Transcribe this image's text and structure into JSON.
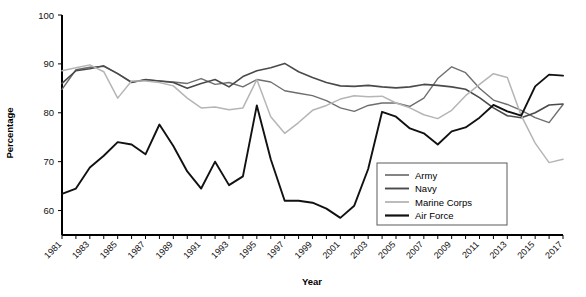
{
  "chart_data": {
    "type": "line",
    "title": "",
    "xlabel": "Year",
    "ylabel": "Percentage",
    "xlim": [
      1981,
      2017
    ],
    "ylim": [
      55,
      100
    ],
    "y_ticks": [
      60,
      70,
      80,
      90,
      100
    ],
    "grid": false,
    "legend_position": "bottom-right",
    "x": [
      1981,
      1982,
      1983,
      1984,
      1985,
      1986,
      1987,
      1988,
      1989,
      1990,
      1991,
      1992,
      1993,
      1994,
      1995,
      1996,
      1997,
      1998,
      1999,
      2000,
      2001,
      2002,
      2003,
      2004,
      2005,
      2006,
      2007,
      2008,
      2009,
      2010,
      2011,
      2012,
      2013,
      2014,
      2015,
      2016,
      2017
    ],
    "x_tick_labels": [
      "1981",
      "1983",
      "1985",
      "1987",
      "1989",
      "1991",
      "1993",
      "1995",
      "1997",
      "1999",
      "2001",
      "2003",
      "2005",
      "2007",
      "2009",
      "2011",
      "2013",
      "2015",
      "2017"
    ],
    "series": [
      {
        "name": "Army",
        "color": "#6e6e6e",
        "width": 1.4,
        "values": [
          84.8,
          88.8,
          89.3,
          89.5,
          88.0,
          86.3,
          86.7,
          86.5,
          86.3,
          86.0,
          87.0,
          85.8,
          86.2,
          85.3,
          86.8,
          86.3,
          84.5,
          84.0,
          83.5,
          82.5,
          81.0,
          80.3,
          81.5,
          82.0,
          82.0,
          81.3,
          83.0,
          87.0,
          89.4,
          88.2,
          85.0,
          82.6,
          81.7,
          80.5,
          79.0,
          78.0,
          81.7
        ]
      },
      {
        "name": "Navy",
        "color": "#4a4a4a",
        "width": 1.6,
        "values": [
          86.0,
          88.6,
          89.0,
          89.6,
          88.0,
          86.2,
          86.8,
          86.5,
          86.2,
          85.0,
          86.0,
          86.8,
          85.3,
          87.4,
          88.6,
          89.2,
          90.1,
          88.4,
          87.2,
          86.2,
          85.5,
          85.4,
          85.6,
          85.3,
          85.1,
          85.3,
          85.8,
          85.6,
          85.3,
          84.8,
          83.1,
          81.0,
          79.4,
          79.0,
          80.0,
          81.6,
          81.8
        ]
      },
      {
        "name": "Marine Corps",
        "color": "#b5b5b5",
        "width": 1.5,
        "values": [
          88.6,
          89.2,
          89.8,
          88.4,
          83.0,
          86.5,
          86.5,
          86.2,
          85.5,
          83.0,
          81.0,
          81.2,
          80.6,
          81.0,
          86.8,
          79.2,
          75.8,
          78.0,
          80.5,
          81.5,
          82.8,
          83.5,
          83.3,
          83.4,
          82.0,
          81.0,
          79.6,
          78.8,
          80.5,
          83.5,
          85.8,
          88.0,
          87.2,
          79.4,
          73.8,
          69.8,
          70.5
        ]
      },
      {
        "name": "Air Force",
        "color": "#111111",
        "width": 1.9,
        "values": [
          63.4,
          64.5,
          68.8,
          71.2,
          74.0,
          73.5,
          71.5,
          77.6,
          73.2,
          68.0,
          64.5,
          70.0,
          65.2,
          67.0,
          81.5,
          70.5,
          62.0,
          62.0,
          61.6,
          60.4,
          58.5,
          61.0,
          68.5,
          80.2,
          79.2,
          76.8,
          75.8,
          73.5,
          76.2,
          77.0,
          79.0,
          81.6,
          80.3,
          79.4,
          85.4,
          87.8,
          87.6
        ]
      }
    ]
  },
  "axis": {
    "ylabel": "Percentage",
    "xlabel": "Year"
  },
  "legend": {
    "items": [
      {
        "label": "Army"
      },
      {
        "label": "Navy"
      },
      {
        "label": "Marine Corps"
      },
      {
        "label": "Air Force"
      }
    ]
  }
}
